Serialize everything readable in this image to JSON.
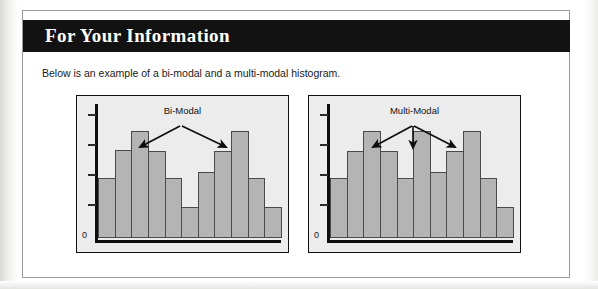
{
  "page": {
    "background_color": "#ffffff"
  },
  "callout": {
    "header_title": "For Your Information",
    "header_background": "#121212",
    "header_text_color": "#ffffff",
    "border_color": "#9a9a9a",
    "body_text": "Below is an example of a bi-modal and a multi-modal histogram."
  },
  "chart_data": [
    {
      "type": "bar",
      "title": "Bi-Modal",
      "panel": "left",
      "categories": [
        "1",
        "2",
        "3",
        "4",
        "5",
        "6",
        "7",
        "8",
        "9",
        "10",
        "11"
      ],
      "values": [
        46,
        68,
        82,
        67,
        46,
        24,
        51,
        67,
        82,
        46,
        24
      ],
      "xlabel": "",
      "ylabel": "",
      "ylim": [
        0,
        100
      ],
      "y_tick_count": 4,
      "zero_label": "0",
      "grid": false,
      "legend": "none",
      "bar_fill": "#b4b4b4",
      "bar_stroke": "#4a4a4a",
      "panel_background": "#ececec",
      "annotations": [
        {
          "label": "Bi-Modal",
          "points_to_bars": [
            3,
            9
          ],
          "arrow_count": 2
        }
      ]
    },
    {
      "type": "bar",
      "title": "Multi-Modal",
      "panel": "right",
      "categories": [
        "1",
        "2",
        "3",
        "4",
        "5",
        "6",
        "7",
        "8",
        "9",
        "10",
        "11"
      ],
      "values": [
        46,
        67,
        82,
        67,
        46,
        82,
        51,
        67,
        82,
        46,
        24
      ],
      "xlabel": "",
      "ylabel": "",
      "ylim": [
        0,
        100
      ],
      "y_tick_count": 4,
      "zero_label": "0",
      "grid": false,
      "legend": "none",
      "bar_fill": "#b4b4b4",
      "bar_stroke": "#4a4a4a",
      "panel_background": "#ececec",
      "annotations": [
        {
          "label": "Multi-Modal",
          "points_to_bars": [
            3,
            6,
            9
          ],
          "arrow_count": 3
        }
      ]
    }
  ]
}
